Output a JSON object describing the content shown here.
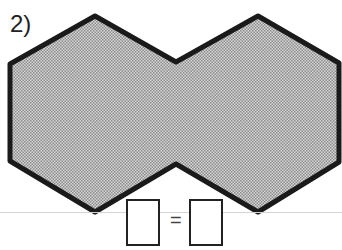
{
  "problem": {
    "number_label": "2)",
    "figure": {
      "description": "two-hexagon-outline-joined-shape",
      "fill_color": "#b0b0b0",
      "stroke_color": "#1a1a1a",
      "vertices": [
        [
          95,
          16
        ],
        [
          176,
          62
        ],
        [
          258,
          16
        ],
        [
          340,
          64
        ],
        [
          340,
          162
        ],
        [
          258,
          212
        ],
        [
          176,
          164
        ],
        [
          95,
          212
        ],
        [
          10,
          160
        ],
        [
          10,
          64
        ]
      ]
    },
    "equation": {
      "left_box": "",
      "operator": "=",
      "right_box": ""
    }
  }
}
